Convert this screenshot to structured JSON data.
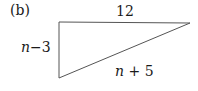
{
  "figure": {
    "part_label": "(b)",
    "shape": "right-triangle",
    "sides": {
      "top": "12",
      "left": {
        "var": "n",
        "op": "−",
        "num": "3"
      },
      "hypotenuse": {
        "var": "n",
        "op": "+",
        "num": "5"
      }
    },
    "stroke_color": "#555555"
  }
}
